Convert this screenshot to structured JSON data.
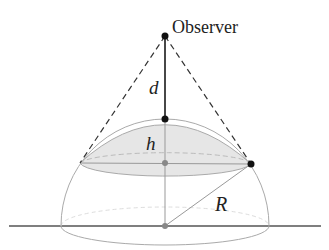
{
  "diagram": {
    "labels": {
      "observer": "Observer",
      "distance": "d",
      "cap_height": "h",
      "radius": "R"
    },
    "colors": {
      "line_dark": "#222222",
      "line_gray": "#9a9a9a",
      "cap_fill": "#e6e6e6",
      "ground": "#444444"
    }
  }
}
